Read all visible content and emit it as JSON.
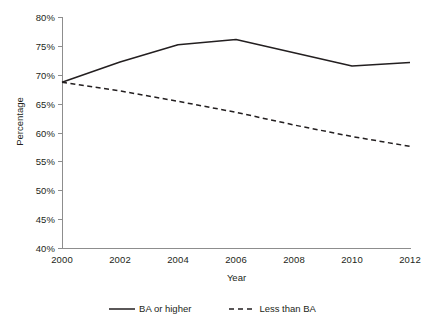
{
  "chart_data": {
    "type": "line",
    "title": "",
    "xlabel": "Year",
    "ylabel": "Percentage",
    "x": [
      2000,
      2002,
      2004,
      2006,
      2008,
      2010,
      2012
    ],
    "xtick_labels": [
      "2000",
      "2002",
      "2004",
      "2006",
      "2008",
      "2010",
      "2012"
    ],
    "xlim": [
      2000,
      2012
    ],
    "ylim": [
      40,
      80
    ],
    "ytick_values": [
      40,
      45,
      50,
      55,
      60,
      65,
      70,
      75,
      80
    ],
    "ytick_labels": [
      "40%",
      "45%",
      "50%",
      "55%",
      "60%",
      "65%",
      "70%",
      "75%",
      "80%"
    ],
    "grid": false,
    "legend_position": "bottom",
    "series": [
      {
        "name": "BA or higher",
        "style": "solid",
        "color": "#231f20",
        "values": [
          68.7,
          72.2,
          75.2,
          76.1,
          73.8,
          71.5,
          72.1
        ]
      },
      {
        "name": "Less than BA",
        "style": "dashed",
        "color": "#231f20",
        "values": [
          68.7,
          67.2,
          65.4,
          63.5,
          61.3,
          59.3,
          57.6
        ]
      }
    ]
  },
  "legend": {
    "items": [
      {
        "label": "BA or higher",
        "style": "solid"
      },
      {
        "label": "Less than BA",
        "style": "dashed"
      }
    ]
  },
  "axes": {
    "x_title": "Year",
    "y_title": "Percentage"
  },
  "colors": {
    "line": "#231f20",
    "axis": "#8d8d8d",
    "text": "#231f20",
    "background": "#ffffff"
  }
}
